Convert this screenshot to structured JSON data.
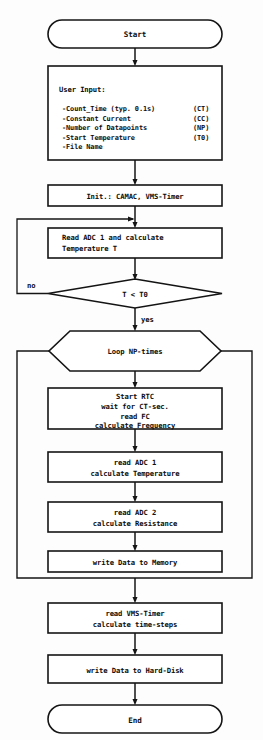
{
  "diagram": {
    "type": "flowchart",
    "colors": {
      "stroke": "#141414",
      "fill": "#ffffff",
      "background": "#fdfdfd",
      "text": "#0d0d0d"
    },
    "nodes": {
      "start": {
        "label": "Start",
        "shape": "terminator"
      },
      "user_input": {
        "shape": "process",
        "heading": "User Input:",
        "items": [
          {
            "text": "-Count_Time (typ. 0.1s)",
            "code": "(CT)"
          },
          {
            "text": "-Constant Current",
            "code": "(CC)"
          },
          {
            "text": "-Number of Datapoints",
            "code": "(NP)"
          },
          {
            "text": "-Start Temperature",
            "code": "(T0)"
          },
          {
            "text": "-File Name",
            "code": ""
          }
        ]
      },
      "init": {
        "shape": "process",
        "line1": "Init.: CAMAC, VMS-Timer"
      },
      "read_adc_temp": {
        "shape": "process",
        "line1": "Read ADC 1 and calculate",
        "line2": "Temperature T"
      },
      "decision": {
        "shape": "decision",
        "label": "T < T0",
        "no_label": "no",
        "yes_label": "yes"
      },
      "loop": {
        "shape": "hexagon",
        "label": "Loop NP-times"
      },
      "start_rtc": {
        "shape": "process",
        "line1": "Start RTC",
        "line2": "wait for CT-sec.",
        "line3": "read FC",
        "line4": "calculate Frequency"
      },
      "read_adc1": {
        "shape": "process",
        "line1": "read ADC 1",
        "line2": "calculate Temperature"
      },
      "read_adc2": {
        "shape": "process",
        "line1": "read ADC 2",
        "line2": "calculate Resistance"
      },
      "write_memory": {
        "shape": "process",
        "line1": "write Data to Memory"
      },
      "read_timer": {
        "shape": "process",
        "line1": "read VMS-Timer",
        "line2": "calculate time-steps"
      },
      "write_disk": {
        "shape": "process",
        "line1": "write Data to Hard-Disk"
      },
      "end": {
        "label": "End",
        "shape": "terminator"
      }
    }
  }
}
